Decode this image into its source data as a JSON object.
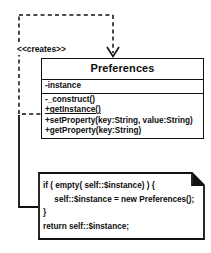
{
  "diagram": {
    "kind": "uml-class-diagram",
    "stereotype_label": "<<creates>>",
    "colors": {
      "stroke": "#111111",
      "text": "#0d0d0d",
      "background": "#ffffff"
    }
  },
  "class_box": {
    "name": "Preferences",
    "attributes": [
      {
        "text": "-instance",
        "static": false
      }
    ],
    "operations": [
      {
        "text": "-_construct()",
        "static": false
      },
      {
        "text": "+getInstance()",
        "static": true
      },
      {
        "text": "+setProperty(key:String, value:String)",
        "static": false
      },
      {
        "text": "+getProperty(key:String)",
        "static": false
      }
    ]
  },
  "note": {
    "lines": [
      "if ( empty( self::$instance) ) {",
      "     self::$instance = new Preferences();",
      "}",
      "return self::$instance;"
    ]
  }
}
